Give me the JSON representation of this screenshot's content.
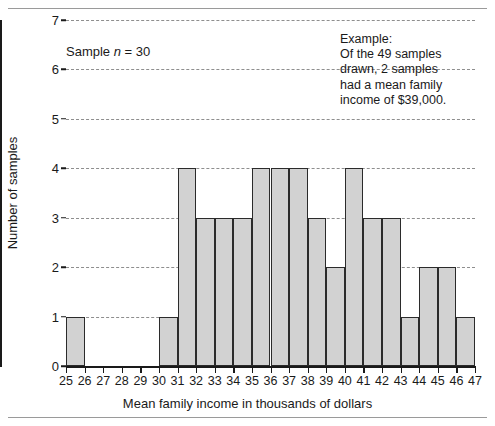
{
  "chart_data": {
    "type": "bar",
    "title": "",
    "xlabel": "Mean family income in thousands of dollars",
    "ylabel": "Number of samples",
    "xlim": [
      25,
      47
    ],
    "ylim": [
      0,
      7
    ],
    "grid": true,
    "legend": null,
    "bin_width": 1,
    "x_tick_labels": [
      "25",
      "26",
      "27",
      "28",
      "29",
      "30",
      "31",
      "32",
      "33",
      "34",
      "35",
      "36",
      "37",
      "38",
      "39",
      "40",
      "41",
      "42",
      "43",
      "44",
      "45",
      "46",
      "47"
    ],
    "y_tick_labels": [
      "0",
      "1",
      "2",
      "3",
      "4",
      "5",
      "6",
      "7"
    ],
    "bins": [
      {
        "start": 25,
        "end": 26,
        "value": 1
      },
      {
        "start": 26,
        "end": 27,
        "value": 0
      },
      {
        "start": 27,
        "end": 28,
        "value": 0
      },
      {
        "start": 28,
        "end": 29,
        "value": 0
      },
      {
        "start": 29,
        "end": 30,
        "value": 0
      },
      {
        "start": 30,
        "end": 31,
        "value": 1
      },
      {
        "start": 31,
        "end": 32,
        "value": 4
      },
      {
        "start": 32,
        "end": 33,
        "value": 3
      },
      {
        "start": 33,
        "end": 34,
        "value": 3
      },
      {
        "start": 34,
        "end": 35,
        "value": 3
      },
      {
        "start": 35,
        "end": 36,
        "value": 4
      },
      {
        "start": 36,
        "end": 37,
        "value": 4
      },
      {
        "start": 37,
        "end": 38,
        "value": 4
      },
      {
        "start": 38,
        "end": 39,
        "value": 3
      },
      {
        "start": 39,
        "end": 40,
        "value": 2
      },
      {
        "start": 40,
        "end": 41,
        "value": 4
      },
      {
        "start": 41,
        "end": 42,
        "value": 3
      },
      {
        "start": 42,
        "end": 43,
        "value": 3
      },
      {
        "start": 43,
        "end": 44,
        "value": 1
      },
      {
        "start": 44,
        "end": 45,
        "value": 2
      },
      {
        "start": 45,
        "end": 46,
        "value": 2
      },
      {
        "start": 46,
        "end": 47,
        "value": 1
      }
    ],
    "annotations": [
      {
        "name": "sample-size-note",
        "text_prefix": "Sample ",
        "text_italic": "n",
        "text_suffix": " = 30"
      },
      {
        "name": "example-note",
        "lines": [
          "Example:",
          "Of the 49 samples",
          "drawn, 2 samples",
          "had a mean family",
          "income of $39,000."
        ]
      }
    ],
    "colors": {
      "bar_fill": "#d2d2d2",
      "bar_border": "#2b2b2b",
      "grid": "#8e8e8e",
      "axis": "#1a1a1a",
      "text": "#1a1a1a",
      "rule": "#9a9a9a"
    }
  }
}
